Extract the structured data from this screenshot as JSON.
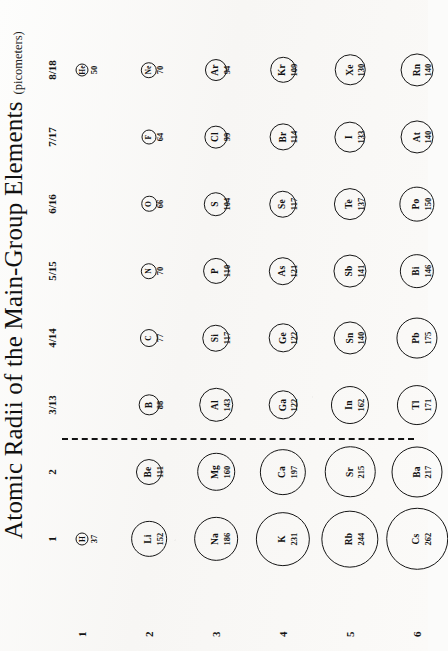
{
  "chart_data": {
    "type": "scatter",
    "title": "Atomic Radii of the Main-Group Elements",
    "subtitle": "(picometers)",
    "xlabel": "Group",
    "ylabel": "Period",
    "grid": false,
    "legend": "none",
    "units": "picometers",
    "note": "Circle diameter is proportional to atomic radius; dashed line separates groups 2 and 3/13 (metal / nonmetal boundary).",
    "group_headers": [
      "1",
      "2",
      "3/13",
      "4/14",
      "5/15",
      "6/16",
      "7/17",
      "8/18"
    ],
    "period_labels": [
      "1",
      "2",
      "3",
      "4",
      "5",
      "6"
    ],
    "divider_after_group": "2",
    "categories": [
      "1",
      "2",
      "3/13",
      "4/14",
      "5/15",
      "6/16",
      "7/17",
      "8/18"
    ],
    "points": [
      {
        "symbol": "H",
        "radius": 37,
        "period": 1,
        "group": "1"
      },
      {
        "symbol": "He",
        "radius": 50,
        "period": 1,
        "group": "8/18"
      },
      {
        "symbol": "Li",
        "radius": 152,
        "period": 2,
        "group": "1"
      },
      {
        "symbol": "Be",
        "radius": 111,
        "period": 2,
        "group": "2"
      },
      {
        "symbol": "B",
        "radius": 88,
        "period": 2,
        "group": "3/13"
      },
      {
        "symbol": "C",
        "radius": 77,
        "period": 2,
        "group": "4/14"
      },
      {
        "symbol": "N",
        "radius": 70,
        "period": 2,
        "group": "5/15"
      },
      {
        "symbol": "O",
        "radius": 66,
        "period": 2,
        "group": "6/16"
      },
      {
        "symbol": "F",
        "radius": 64,
        "period": 2,
        "group": "7/17"
      },
      {
        "symbol": "Ne",
        "radius": 70,
        "period": 2,
        "group": "8/18"
      },
      {
        "symbol": "Na",
        "radius": 186,
        "period": 3,
        "group": "1"
      },
      {
        "symbol": "Mg",
        "radius": 160,
        "period": 3,
        "group": "2"
      },
      {
        "symbol": "Al",
        "radius": 143,
        "period": 3,
        "group": "3/13"
      },
      {
        "symbol": "Si",
        "radius": 117,
        "period": 3,
        "group": "4/14"
      },
      {
        "symbol": "P",
        "radius": 110,
        "period": 3,
        "group": "5/15"
      },
      {
        "symbol": "S",
        "radius": 104,
        "period": 3,
        "group": "6/16"
      },
      {
        "symbol": "Cl",
        "radius": 99,
        "period": 3,
        "group": "7/17"
      },
      {
        "symbol": "Ar",
        "radius": 94,
        "period": 3,
        "group": "8/18"
      },
      {
        "symbol": "K",
        "radius": 231,
        "period": 4,
        "group": "1"
      },
      {
        "symbol": "Ca",
        "radius": 197,
        "period": 4,
        "group": "2"
      },
      {
        "symbol": "Ga",
        "radius": 122,
        "period": 4,
        "group": "3/13"
      },
      {
        "symbol": "Ge",
        "radius": 122,
        "period": 4,
        "group": "4/14"
      },
      {
        "symbol": "As",
        "radius": 121,
        "period": 4,
        "group": "5/15"
      },
      {
        "symbol": "Se",
        "radius": 117,
        "period": 4,
        "group": "6/16"
      },
      {
        "symbol": "Br",
        "radius": 114,
        "period": 4,
        "group": "7/17"
      },
      {
        "symbol": "Kr",
        "radius": 109,
        "period": 4,
        "group": "8/18"
      },
      {
        "symbol": "Rb",
        "radius": 244,
        "period": 5,
        "group": "1"
      },
      {
        "symbol": "Sr",
        "radius": 215,
        "period": 5,
        "group": "2"
      },
      {
        "symbol": "In",
        "radius": 162,
        "period": 5,
        "group": "3/13"
      },
      {
        "symbol": "Sn",
        "radius": 140,
        "period": 5,
        "group": "4/14"
      },
      {
        "symbol": "Sb",
        "radius": 141,
        "period": 5,
        "group": "5/15"
      },
      {
        "symbol": "Te",
        "radius": 137,
        "period": 5,
        "group": "6/16"
      },
      {
        "symbol": "I",
        "radius": 133,
        "period": 5,
        "group": "7/17"
      },
      {
        "symbol": "Xe",
        "radius": 130,
        "period": 5,
        "group": "8/18"
      },
      {
        "symbol": "Cs",
        "radius": 262,
        "period": 6,
        "group": "1"
      },
      {
        "symbol": "Ba",
        "radius": 217,
        "period": 6,
        "group": "2"
      },
      {
        "symbol": "Tl",
        "radius": 171,
        "period": 6,
        "group": "3/13"
      },
      {
        "symbol": "Pb",
        "radius": 175,
        "period": 6,
        "group": "4/14"
      },
      {
        "symbol": "Bi",
        "radius": 146,
        "period": 6,
        "group": "5/15"
      },
      {
        "symbol": "Po",
        "radius": 150,
        "period": 6,
        "group": "6/16"
      },
      {
        "symbol": "At",
        "radius": 140,
        "period": 6,
        "group": "7/17"
      },
      {
        "symbol": "Rn",
        "radius": 140,
        "period": 6,
        "group": "8/18"
      }
    ]
  },
  "colors": {
    "ink": "#151515",
    "paper": "#fbfbfa"
  }
}
